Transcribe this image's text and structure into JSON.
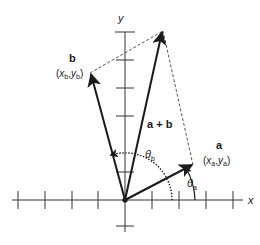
{
  "diagram": {
    "colors": {
      "background": "#ffffff",
      "stroke": "#1a1a1a",
      "axis": "#333333",
      "dashed": "#555555"
    },
    "axes": {
      "x_label": "x",
      "y_label": "y",
      "origin": [
        125,
        200
      ]
    },
    "vectors": {
      "a": {
        "name": "a",
        "coords_open": "(",
        "x": "x",
        "x_sub": "a",
        "sep": ",",
        "y": "y",
        "y_sub": "a",
        "coords_close": ")"
      },
      "b": {
        "name": "b",
        "coords_open": "(",
        "x": "x",
        "x_sub": "b",
        "sep": ",",
        "y": "y",
        "y_sub": "b",
        "coords_close": ")"
      },
      "sum": {
        "name": "a + b"
      }
    },
    "angles": {
      "theta_a": {
        "symbol": "θ",
        "sub": "a"
      },
      "theta_b": {
        "symbol": "θ",
        "sub": "b"
      }
    }
  }
}
